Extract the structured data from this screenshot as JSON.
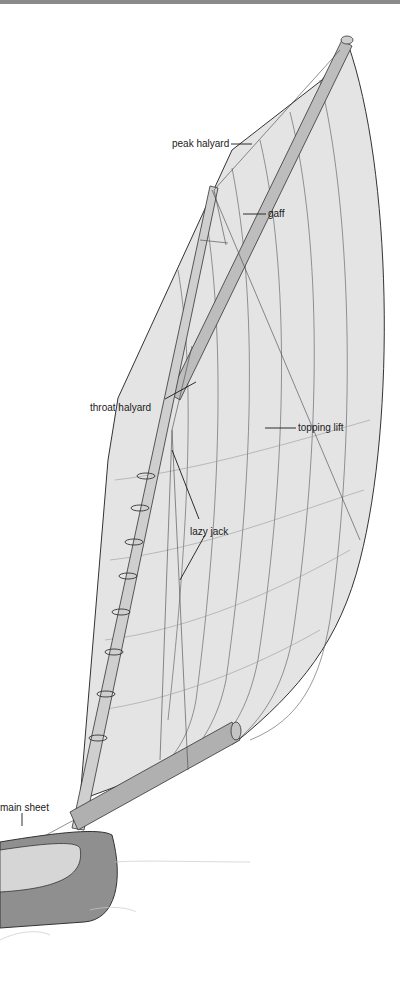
{
  "figure": {
    "colors": {
      "sail_fill": "#e4e4e4",
      "hull_fill": "#8f8f8f",
      "hull_interior": "#d6d6d6",
      "spar_fill": "#bdbdbd",
      "line": "#333333",
      "top_rule": "#8a8a8a"
    },
    "labels": {
      "peak_halyard": "peak halyard",
      "gaff": "gaff",
      "throat_halyard": "throat halyard",
      "topping_lift": "topping lift",
      "lazy_jack": "lazy jack",
      "main_sheet": "main sheet"
    }
  }
}
